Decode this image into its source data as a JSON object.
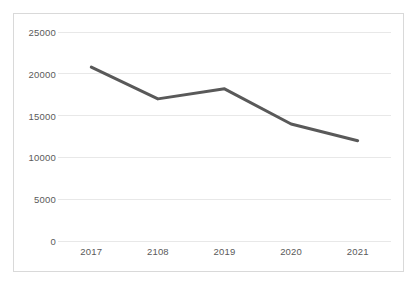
{
  "chart_data": {
    "type": "line",
    "title": "",
    "subtitle": "",
    "xlabel": "",
    "ylabel": "",
    "categories": [
      "2017",
      "2108",
      "2019",
      "2020",
      "2021"
    ],
    "values": [
      20800,
      17000,
      18200,
      14000,
      12000
    ],
    "series": [
      {
        "name": "",
        "values": [
          20800,
          17000,
          18200,
          14000,
          12000
        ],
        "color": "#595959"
      }
    ],
    "ylim": [
      0,
      25000
    ],
    "yticks": [
      0,
      5000,
      10000,
      15000,
      20000,
      25000
    ],
    "ytick_labels": [
      "0",
      "5000",
      "10000",
      "15000",
      "20000",
      "25000"
    ],
    "xtick_labels": [
      "2017",
      "2108",
      "2019",
      "2020",
      "2021"
    ],
    "grid": true,
    "grid_axis": "y",
    "legend": false,
    "legend_position": "none",
    "markers": false,
    "annotations": []
  },
  "style": {
    "line_color": "#595959",
    "grid_color": "#e8e8e8",
    "border_color": "#d9d9d9",
    "text_color": "#5a5a5a",
    "background": "#ffffff"
  }
}
